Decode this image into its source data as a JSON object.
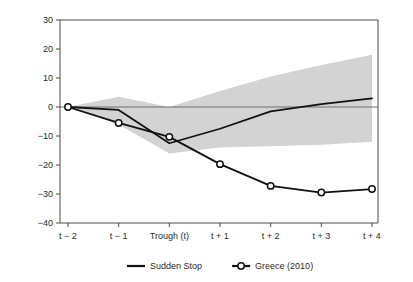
{
  "chart_data": {
    "type": "line",
    "title": "",
    "subtitle": "",
    "xlabel": "",
    "ylabel": "",
    "categories": [
      "t − 2",
      "t − 1",
      "Trough (t)",
      "t + 1",
      "t + 2",
      "t + 3",
      "t + 4"
    ],
    "x_index": [
      0,
      1,
      2,
      3,
      4,
      5,
      6
    ],
    "ylim": [
      -40,
      30
    ],
    "yticks": [
      30,
      20,
      10,
      0,
      -10,
      -20,
      -30,
      -40
    ],
    "ytick_labels": [
      "30",
      "20",
      "10",
      "0",
      "−10",
      "−20",
      "−30",
      "−40"
    ],
    "grid": false,
    "legend_position": "bottom",
    "zero_reference_line": 0,
    "series": [
      {
        "name": "Sudden Stop",
        "marker": "none",
        "color": "#111111",
        "values": [
          0,
          -1,
          -12.5,
          -7.5,
          -1.5,
          1,
          3
        ]
      },
      {
        "name": "Greece (2010)",
        "marker": "open-circle",
        "color": "#111111",
        "values": [
          0,
          -5.5,
          -10.3,
          -19.7,
          -27.2,
          -29.5,
          -28.3
        ]
      }
    ],
    "band": {
      "name": "Sudden Stop confidence band",
      "color": "#d3d3d3",
      "x_index": [
        0,
        1,
        2,
        3,
        4,
        5,
        6
      ],
      "upper": [
        0,
        3.5,
        0,
        5.5,
        10.5,
        14.5,
        18.0
      ],
      "lower": [
        0,
        -6.0,
        -16.0,
        -14.0,
        -13.5,
        -13.0,
        -12.0
      ],
      "ends_before_right_axis": true
    },
    "legend": [
      {
        "label": "Sudden Stop",
        "marker": "line"
      },
      {
        "label": "Greece (2010)",
        "marker": "line-open-circle"
      }
    ]
  }
}
